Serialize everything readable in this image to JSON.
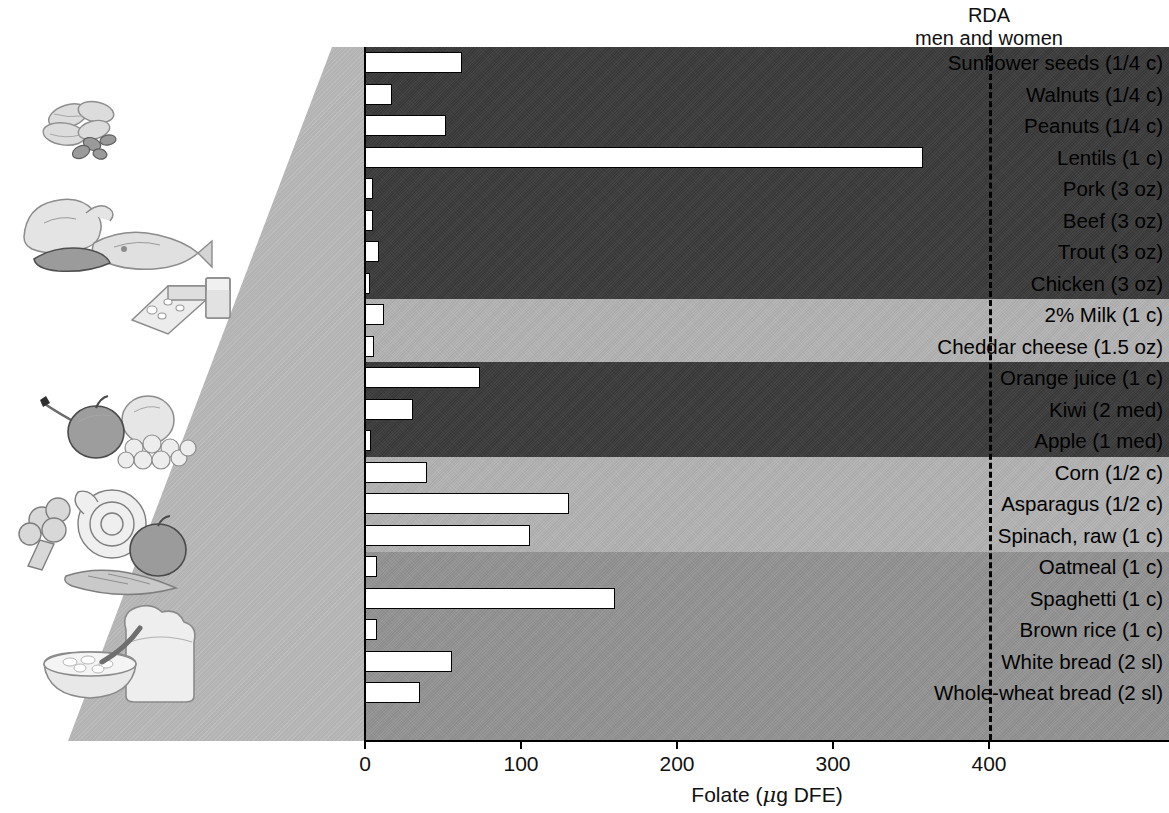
{
  "chart_data": {
    "type": "bar",
    "orientation": "horizontal",
    "title": "",
    "xlabel": "Folate (μg DFE)",
    "ylabel": "",
    "xlim": [
      0,
      515
    ],
    "xticks": [
      0,
      100,
      200,
      300,
      400
    ],
    "xtick_labels": [
      "0",
      "100",
      "200",
      "300",
      "400"
    ],
    "grid": false,
    "legend": "none",
    "categories": [
      "Sunflower seeds (1/4 c)",
      "Walnuts (1/4 c)",
      "Peanuts (1/4 c)",
      "Lentils (1 c)",
      "Pork (3 oz)",
      "Beef (3 oz)",
      "Trout (3 oz)",
      "Chicken (3 oz)",
      "2% Milk (1 c)",
      "Cheddar cheese (1.5 oz)",
      "Orange juice (1 c)",
      "Kiwi (2 med)",
      "Apple (1 med)",
      "Corn (1/2 c)",
      "Asparagus (1/2 c)",
      "Spinach, raw (1 c)",
      "Oatmeal (1 c)",
      "Spaghetti (1 c)",
      "Brown rice (1 c)",
      "White bread (2 sl)",
      "Whole-wheat bread (2 sl)"
    ],
    "values": [
      62,
      17,
      52,
      358,
      5,
      5,
      9,
      3,
      12,
      6,
      74,
      31,
      4,
      40,
      131,
      106,
      8,
      160,
      8,
      56,
      35
    ],
    "annotations": [
      {
        "name": "rda",
        "label_line1": "RDA",
        "label_line2": "men and women",
        "value": 400,
        "style": "dashed-vertical-line"
      }
    ],
    "group_bands": [
      {
        "group": "nuts-legumes-meats",
        "from": "Sunflower seeds (1/4 c)",
        "to": "Chicken (3 oz)",
        "color": "#3b3b3b"
      },
      {
        "group": "milk-dairy",
        "from": "2% Milk (1 c)",
        "to": "Cheddar cheese (1.5 oz)",
        "color": "#b4b4b4"
      },
      {
        "group": "fruits",
        "from": "Orange juice (1 c)",
        "to": "Apple (1 med)",
        "color": "#3b3b3b"
      },
      {
        "group": "vegetables",
        "from": "Corn (1/2 c)",
        "to": "Spinach, raw (1 c)",
        "color": "#b4b4b4"
      },
      {
        "group": "grains",
        "from": "Oatmeal (1 c)",
        "to": "Whole-wheat bread (2 sl)",
        "color": "#949494"
      }
    ],
    "bar_style": {
      "fill": "#ffffff",
      "edge": "#000000"
    }
  },
  "axis": {
    "x_title_prefix": "Folate (",
    "x_title_mu": "μ",
    "x_title_suffix": "g DFE)"
  },
  "illustrations": [
    {
      "name": "nuts-illustration",
      "alt": "peanuts and walnuts"
    },
    {
      "name": "meats-illustration",
      "alt": "chicken, fish and steak"
    },
    {
      "name": "dairy-illustration",
      "alt": "cheese wedge and milk glass"
    },
    {
      "name": "fruits-illustration",
      "alt": "apple, pear and grapes"
    },
    {
      "name": "vegetables-illustration",
      "alt": "broccoli, lettuce, tomato and carrot"
    },
    {
      "name": "grains-illustration",
      "alt": "bread slice and bowl of oatmeal"
    }
  ],
  "caption": ""
}
